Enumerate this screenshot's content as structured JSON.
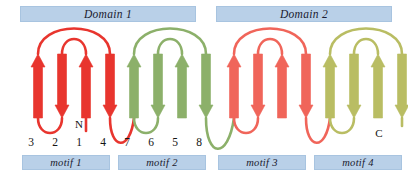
{
  "figure": {
    "type": "protein-topology-diagram",
    "width": 408,
    "height": 173
  },
  "colors": {
    "domain_bar_fill": "#b9d0e8",
    "domain_bar_stroke": "#a8c4e0",
    "motif_bar_fill": "#b9d0e8",
    "motif_bar_stroke": "#a8c4e0",
    "motif1_red": "#e8352e",
    "motif2_green": "#8cb06a",
    "motif3_salmon": "#f0655a",
    "motif4_olive": "#b9bd63",
    "text": "#141414",
    "background": "#ffffff"
  },
  "domains": [
    {
      "id": "domain-1",
      "label": "Domain 1",
      "x": 20,
      "y": 6,
      "width": 176
    },
    {
      "id": "domain-2",
      "label": "Domain 2",
      "x": 216,
      "y": 6,
      "width": 176
    }
  ],
  "motifs": [
    {
      "id": "motif-1",
      "label": "motif 1",
      "color_key": "motif1_red",
      "x": 22,
      "y": 155,
      "width": 88
    },
    {
      "id": "motif-2",
      "label": "motif 2",
      "color_key": "motif2_green",
      "x": 118,
      "y": 155,
      "width": 88
    },
    {
      "id": "motif-3",
      "label": "motif 3",
      "color_key": "motif3_salmon",
      "x": 218,
      "y": 155,
      "width": 88
    },
    {
      "id": "motif-4",
      "label": "motif 4",
      "color_key": "motif4_olive",
      "x": 314,
      "y": 155,
      "width": 88
    }
  ],
  "strand_labels": [
    {
      "text": "3",
      "x": 31,
      "y": 136
    },
    {
      "text": "2",
      "x": 55,
      "y": 136
    },
    {
      "text": "1",
      "x": 79,
      "y": 136
    },
    {
      "text": "4",
      "x": 103,
      "y": 136
    },
    {
      "text": "7",
      "x": 127,
      "y": 136
    },
    {
      "text": "6",
      "x": 151,
      "y": 136
    },
    {
      "text": "5",
      "x": 175,
      "y": 136
    },
    {
      "text": "8",
      "x": 199,
      "y": 136
    }
  ],
  "termini": [
    {
      "text": "N",
      "x": 79,
      "y": 118,
      "strand": "1"
    },
    {
      "text": "C",
      "x": 379,
      "y": 127,
      "strand": "16"
    }
  ],
  "strands": [
    {
      "id": "s3",
      "motif": "motif-1",
      "label": "3",
      "x": 38,
      "direction": "up",
      "color_key": "motif1_red"
    },
    {
      "id": "s2",
      "motif": "motif-1",
      "label": "2",
      "x": 62,
      "direction": "down",
      "color_key": "motif1_red"
    },
    {
      "id": "s1",
      "motif": "motif-1",
      "label": "1",
      "x": 86,
      "direction": "up",
      "color_key": "motif1_red"
    },
    {
      "id": "s4",
      "motif": "motif-1",
      "label": "4",
      "x": 110,
      "direction": "down",
      "color_key": "motif1_red"
    },
    {
      "id": "s7",
      "motif": "motif-2",
      "label": "7",
      "x": 134,
      "direction": "up",
      "color_key": "motif2_green"
    },
    {
      "id": "s6",
      "motif": "motif-2",
      "label": "6",
      "x": 158,
      "direction": "down",
      "color_key": "motif2_green"
    },
    {
      "id": "s5",
      "motif": "motif-2",
      "label": "5",
      "x": 182,
      "direction": "up",
      "color_key": "motif2_green"
    },
    {
      "id": "s8",
      "motif": "motif-2",
      "label": "8",
      "x": 206,
      "direction": "down",
      "color_key": "motif2_green"
    },
    {
      "id": "s11",
      "motif": "motif-3",
      "label": "",
      "x": 234,
      "direction": "up",
      "color_key": "motif3_salmon"
    },
    {
      "id": "s10",
      "motif": "motif-3",
      "label": "",
      "x": 258,
      "direction": "down",
      "color_key": "motif3_salmon"
    },
    {
      "id": "s9",
      "motif": "motif-3",
      "label": "",
      "x": 282,
      "direction": "up",
      "color_key": "motif3_salmon"
    },
    {
      "id": "s12",
      "motif": "motif-3",
      "label": "",
      "x": 306,
      "direction": "down",
      "color_key": "motif3_salmon"
    },
    {
      "id": "s15",
      "motif": "motif-4",
      "label": "",
      "x": 330,
      "direction": "up",
      "color_key": "motif4_olive"
    },
    {
      "id": "s14",
      "motif": "motif-4",
      "label": "",
      "x": 354,
      "direction": "down",
      "color_key": "motif4_olive"
    },
    {
      "id": "s13",
      "motif": "motif-4",
      "label": "",
      "x": 378,
      "direction": "up",
      "color_key": "motif4_olive"
    },
    {
      "id": "s16",
      "motif": "motif-4",
      "label": "",
      "x": 402,
      "direction": "down",
      "color_key": "motif4_olive"
    }
  ]
}
